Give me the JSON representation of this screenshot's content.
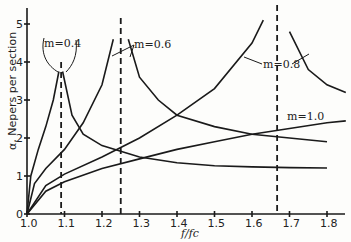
{
  "chart_data": {
    "type": "line",
    "title": "",
    "xlabel": "f/fc",
    "ylabel": "α, Nepers per section",
    "xlim": [
      1.0,
      1.85
    ],
    "ylim": [
      0,
      5.5
    ],
    "xticks": [
      "1.0",
      "1.1",
      "1.2",
      "1.3",
      "1.4",
      "1.5",
      "1.6",
      "1.7",
      "1.8"
    ],
    "yticks": [
      "0",
      "1",
      "2",
      "3",
      "4",
      "5"
    ],
    "grid": false,
    "legend": "inline annotations",
    "asymptotes": [
      {
        "m": "0.4",
        "x": 1.091
      },
      {
        "m": "0.6",
        "x": 1.25
      },
      {
        "m": "0.8",
        "x": 1.667
      }
    ],
    "series": [
      {
        "name": "m=0.4 (below f∞)",
        "x": [
          1.0,
          1.01,
          1.03,
          1.05,
          1.07,
          1.085
        ],
        "y": [
          0,
          1.0,
          1.7,
          2.3,
          3.0,
          3.75
        ]
      },
      {
        "name": "m=0.4 (above f∞)",
        "x": [
          1.095,
          1.12,
          1.15,
          1.2,
          1.3,
          1.4,
          1.5,
          1.6,
          1.7,
          1.8
        ],
        "y": [
          3.75,
          2.6,
          2.1,
          1.8,
          1.5,
          1.35,
          1.27,
          1.24,
          1.22,
          1.21
        ]
      },
      {
        "name": "m=0.6 (below f∞)",
        "x": [
          1.0,
          1.02,
          1.05,
          1.1,
          1.15,
          1.2,
          1.23
        ],
        "y": [
          0,
          0.8,
          1.2,
          1.7,
          2.4,
          3.4,
          4.6
        ]
      },
      {
        "name": "m=0.6 (above f∞)",
        "x": [
          1.27,
          1.3,
          1.35,
          1.4,
          1.5,
          1.6,
          1.7,
          1.8
        ],
        "y": [
          4.6,
          3.6,
          3.0,
          2.6,
          2.3,
          2.1,
          2.0,
          1.9
        ]
      },
      {
        "name": "m=0.8 (below f∞)",
        "x": [
          1.0,
          1.05,
          1.1,
          1.2,
          1.3,
          1.4,
          1.5,
          1.6,
          1.63
        ],
        "y": [
          0,
          0.75,
          1.05,
          1.5,
          2.0,
          2.6,
          3.3,
          4.5,
          5.1
        ]
      },
      {
        "name": "m=0.8 (above f∞)",
        "x": [
          1.7,
          1.75,
          1.8,
          1.85
        ],
        "y": [
          4.8,
          3.8,
          3.4,
          3.2
        ]
      },
      {
        "name": "m=1.0",
        "x": [
          1.0,
          1.05,
          1.1,
          1.2,
          1.3,
          1.4,
          1.5,
          1.6,
          1.7,
          1.8,
          1.85
        ],
        "y": [
          0,
          0.6,
          0.85,
          1.2,
          1.45,
          1.7,
          1.9,
          2.1,
          2.25,
          2.4,
          2.45
        ]
      }
    ],
    "annotations": [
      "m=0.4",
      "m=0.6",
      "m=0.8",
      "m=1.0"
    ]
  },
  "labels": {
    "ylabel": "α, Nepers per section",
    "xlabel": "f/fc",
    "m04": "m=0.4",
    "m06": "m=0.6",
    "m08": "m=0.8",
    "m10": "m=1.0"
  }
}
